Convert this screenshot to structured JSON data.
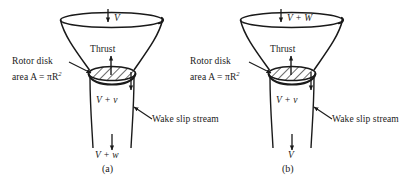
{
  "figure": {
    "type": "actuator-disk-momentum-diagram",
    "panels": [
      {
        "id": "a",
        "caption": "(a)",
        "top_flow_label": "V",
        "thrust_label": "Thrust",
        "rotor_label_line1": "Rotor disk",
        "rotor_label_line2_prefix": "area A = πR",
        "rotor_label_line2_sup": "2",
        "disk_flow_label": "V + v",
        "wake_label": "Wake slip stream",
        "bottom_flow_label": "V + w"
      },
      {
        "id": "b",
        "caption": "(b)",
        "top_flow_label": "V + W",
        "thrust_label": "Thrust",
        "rotor_label_line1": "Rotor disk",
        "rotor_label_line2_prefix": "area A = πR",
        "rotor_label_line2_sup": "2",
        "disk_flow_label": "V + v",
        "wake_label": "Wake slip stream",
        "bottom_flow_label": "V"
      }
    ],
    "colors": {
      "stroke": "#1a1a1a",
      "background": "#ffffff",
      "hatch": "#1a1a1a"
    }
  }
}
